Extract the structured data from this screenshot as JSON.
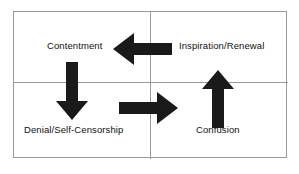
{
  "diagram": {
    "type": "quadrant-cycle",
    "title": "",
    "frame": {
      "border_color": "#9a9a9a",
      "background": "#ffffff",
      "rows": 2,
      "columns": 2
    },
    "quadrants": [
      {
        "id": "top-left",
        "label": "Contentment"
      },
      {
        "id": "top-right",
        "label": "Inspiration/Renewal"
      },
      {
        "id": "bottom-left",
        "label": "Denial/Self-Censorship"
      },
      {
        "id": "bottom-right",
        "label": "Confusion"
      }
    ],
    "arrows": [
      {
        "id": "arrow-left",
        "direction": "left",
        "from": "Inspiration/Renewal",
        "to": "Contentment",
        "color": "#1a1a1a"
      },
      {
        "id": "arrow-down",
        "direction": "down",
        "from": "Contentment",
        "to": "Denial/Self-Censorship",
        "color": "#1a1a1a"
      },
      {
        "id": "arrow-right",
        "direction": "right",
        "from": "Denial/Self-Censorship",
        "to": "Confusion",
        "color": "#1a1a1a"
      },
      {
        "id": "arrow-up",
        "direction": "up",
        "from": "Confusion",
        "to": "Inspiration/Renewal",
        "color": "#1a1a1a"
      }
    ]
  }
}
